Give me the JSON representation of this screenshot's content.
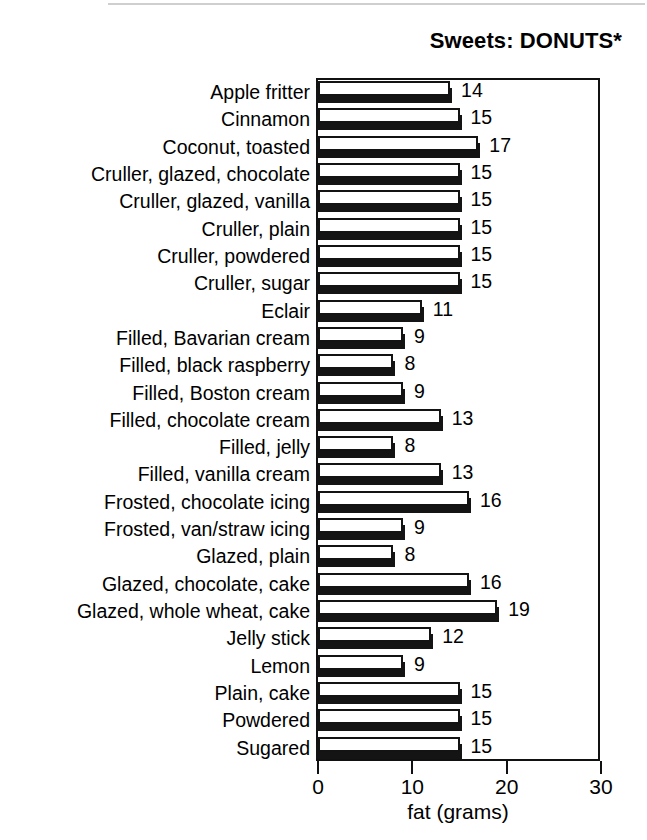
{
  "chart_data": {
    "type": "bar",
    "orientation": "horizontal",
    "title": "Sweets: DONUTS*",
    "xlabel": "fat (grams)",
    "ylabel": "",
    "xlim": [
      0,
      30
    ],
    "xticks": [
      0,
      10,
      20,
      30
    ],
    "xticklabels": [
      "0",
      "10",
      "20",
      "30"
    ],
    "grid": false,
    "legend": false,
    "show_value_labels": true,
    "categories": [
      "Apple fritter",
      "Cinnamon",
      "Coconut, toasted",
      "Cruller, glazed, chocolate",
      "Cruller, glazed, vanilla",
      "Cruller, plain",
      "Cruller, powdered",
      "Cruller, sugar",
      "Eclair",
      "Filled, Bavarian cream",
      "Filled, black raspberry",
      "Filled, Boston cream",
      "Filled, chocolate cream",
      "Filled, jelly",
      "Filled, vanilla cream",
      "Frosted, chocolate icing",
      "Frosted, van/straw icing",
      "Glazed, plain",
      "Glazed, chocolate, cake",
      "Glazed, whole wheat, cake",
      "Jelly stick",
      "Lemon",
      "Plain, cake",
      "Powdered",
      "Sugared"
    ],
    "values": [
      14,
      15,
      17,
      15,
      15,
      15,
      15,
      15,
      11,
      9,
      8,
      9,
      13,
      8,
      13,
      16,
      9,
      8,
      16,
      19,
      12,
      9,
      15,
      15,
      15
    ],
    "value_labels": [
      "14",
      "15",
      "17",
      "15",
      "15",
      "15",
      "15",
      "15",
      "11",
      "9",
      "8",
      "9",
      "13",
      "8",
      "13",
      "16",
      "9",
      "8",
      "16",
      "19",
      "12",
      "9",
      "15",
      "15",
      "15"
    ],
    "colors": {
      "bar_face": "#ffffff",
      "bar_outline": "#131313",
      "bar_shadow": "#141414",
      "axis": "#111111",
      "text": "#000000",
      "background": "#ffffff"
    }
  }
}
